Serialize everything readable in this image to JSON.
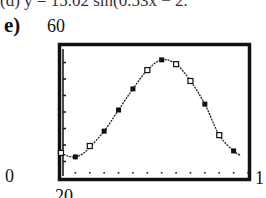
{
  "header": {
    "cropped_top_text": "(d)  y = 15.02 sin(0.53x − 2.",
    "part_label": "e)"
  },
  "window": {
    "xmin_label": "0",
    "xmax_label": "1",
    "ymin_label": "20",
    "ymax_label": "60"
  },
  "chart_data": {
    "type": "scatter",
    "title": "",
    "xlabel": "",
    "ylabel": "",
    "xlim": [
      0,
      13
    ],
    "ylim": [
      20,
      60
    ],
    "grid": false,
    "tick_labels": {
      "y_top": "60",
      "y_bottom": "20",
      "x_left": "0",
      "x_right": "1 (cut off, likely 13)"
    },
    "series": [
      {
        "name": "data points (filled)",
        "marker": "filled-square",
        "x": [
          1,
          3,
          4,
          5,
          7,
          10,
          12
        ],
        "y": [
          26.4,
          34.2,
          40.6,
          47.0,
          55.8,
          42.4,
          28.2
        ]
      },
      {
        "name": "data points (hollow)",
        "marker": "hollow-square",
        "x": [
          0,
          2,
          6,
          8,
          9,
          11
        ],
        "y": [
          27.6,
          29.7,
          52.7,
          54.5,
          49.4,
          33.0
        ]
      },
      {
        "name": "fitted sine curve",
        "type": "line",
        "style": "dotted-connected",
        "x": [
          0,
          0.5,
          1,
          1.5,
          2,
          3,
          4,
          5,
          6,
          7,
          8,
          9,
          10,
          11,
          12,
          12.5
        ],
        "y": [
          27.6,
          26.6,
          26.4,
          27.3,
          29.3,
          34.2,
          40.6,
          47.0,
          52.7,
          55.8,
          54.5,
          49.4,
          42.4,
          33.0,
          28.2,
          26.8
        ]
      }
    ],
    "annotations": [
      "row of x-axis tick dots near bottom of window"
    ],
    "legend": "none"
  }
}
